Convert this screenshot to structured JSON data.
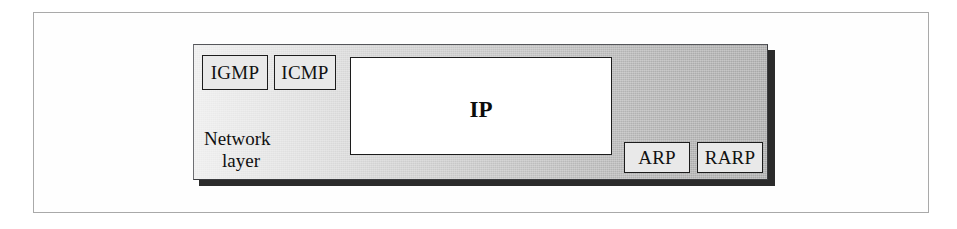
{
  "figure": {
    "background_color": "#ffffff",
    "frame_color": "#a9a9a9"
  },
  "panel": {
    "name": "network-layer",
    "caption_line_1": "Network",
    "caption_line_2": "layer",
    "fill_from": "#ededed",
    "fill_to": "#a8a8a8",
    "shadow_color": "#2b2b2b"
  },
  "main_protocol": {
    "label": "IP",
    "fill": "#ffffff",
    "border": "#1c1c1c"
  },
  "upper_protocols": [
    {
      "label": "IGMP"
    },
    {
      "label": "ICMP"
    }
  ],
  "lower_protocols": [
    {
      "label": "ARP"
    },
    {
      "label": "RARP"
    }
  ]
}
